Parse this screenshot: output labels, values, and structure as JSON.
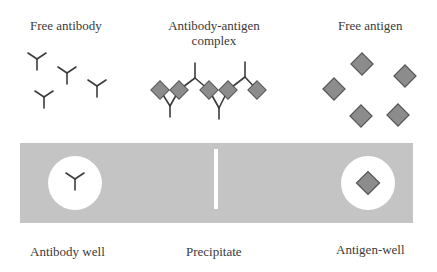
{
  "labels": {
    "free_antibody": "Free antibody",
    "complex_line1": "Antibody-antigen",
    "complex_line2": "complex",
    "free_antigen": "Free antigen",
    "antibody_well": "Antibody well",
    "precipitate": "Precipitate",
    "antigen_well": "Antigen-well"
  },
  "colors": {
    "gel": "#c4c4c4",
    "well": "#ffffff",
    "antigen_fill": "#8c8c8c",
    "antigen_stroke": "#555555",
    "antibody_stroke": "#3c3c3c",
    "precipitate_line": "#ffffff"
  }
}
